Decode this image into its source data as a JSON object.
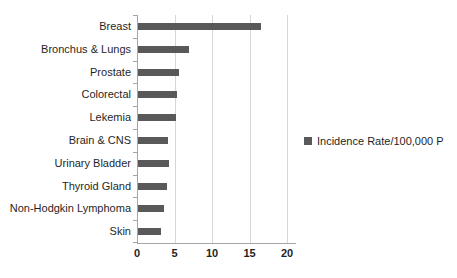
{
  "chart_data": {
    "type": "bar",
    "orientation": "horizontal",
    "title": "",
    "xlabel": "",
    "ylabel": "",
    "categories": [
      "Breast",
      "Bronchus & Lungs",
      "Prostate",
      "Colorectal",
      "Lekemia",
      "Brain & CNS",
      "Urinary Bladder",
      "Thyroid Gland",
      "Non-Hodgkin Lymphoma",
      "Skin"
    ],
    "values": [
      16.4,
      6.8,
      5.4,
      5.2,
      5.0,
      4.0,
      4.1,
      3.9,
      3.4,
      3.1
    ],
    "legend": "Incidence Rate/100,000 P",
    "legend_position": "right",
    "xlim": [
      0,
      20
    ],
    "xticks": [
      0,
      5,
      10,
      15,
      20
    ],
    "grid": "vertical",
    "bar_color": "#595959",
    "gridline_color": "#d6d6d6",
    "axis_color": "#a6a6a6"
  }
}
